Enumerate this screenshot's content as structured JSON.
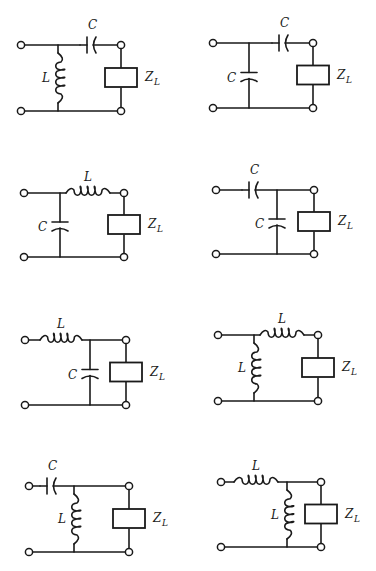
{
  "figure": {
    "load_label": "Z",
    "load_subscript": "L",
    "networks": [
      {
        "id": 1,
        "series": {
          "type": "C",
          "label": "C"
        },
        "shunt": {
          "type": "L",
          "label": "L"
        },
        "shunt_position": "input"
      },
      {
        "id": 2,
        "series": {
          "type": "C",
          "label": "C"
        },
        "shunt": {
          "type": "C",
          "label": "C"
        },
        "shunt_position": "input"
      },
      {
        "id": 3,
        "series": {
          "type": "L",
          "label": "L"
        },
        "shunt": {
          "type": "C",
          "label": "C"
        },
        "shunt_position": "input"
      },
      {
        "id": 4,
        "series": {
          "type": "C",
          "label": "C"
        },
        "shunt": {
          "type": "C",
          "label": "C"
        },
        "shunt_position": "load"
      },
      {
        "id": 5,
        "series": {
          "type": "L",
          "label": "L"
        },
        "shunt": {
          "type": "C",
          "label": "C"
        },
        "shunt_position": "load"
      },
      {
        "id": 6,
        "series": {
          "type": "L",
          "label": "L"
        },
        "shunt": {
          "type": "L",
          "label": "L"
        },
        "shunt_position": "input"
      },
      {
        "id": 7,
        "series": {
          "type": "C",
          "label": "C"
        },
        "shunt": {
          "type": "L",
          "label": "L"
        },
        "shunt_position": "load"
      },
      {
        "id": 8,
        "series": {
          "type": "L",
          "label": "L"
        },
        "shunt": {
          "type": "L",
          "label": "L"
        },
        "shunt_position": "load"
      }
    ]
  }
}
